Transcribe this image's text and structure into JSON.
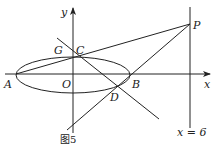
{
  "diagram": {
    "caption": "图5",
    "axes": {
      "x_label": "x",
      "y_label": "y",
      "origin_label": "O"
    },
    "points": {
      "A": "A",
      "B": "B",
      "C": "C",
      "D": "D",
      "G": "G",
      "P": "P"
    },
    "line_label": "x = 6",
    "colors": {
      "stroke": "#222222",
      "background": "#ffffff"
    }
  }
}
